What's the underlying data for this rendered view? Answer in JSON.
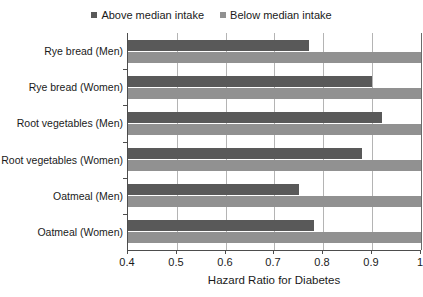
{
  "chart_data": {
    "type": "bar",
    "orientation": "horizontal",
    "title": "",
    "xlabel": "Hazard Ratio for Diabetes",
    "ylabel": "",
    "xlim": [
      0.4,
      1.0
    ],
    "xticks": [
      "0.4",
      "0.5",
      "0.6",
      "0.7",
      "0.8",
      "0.9",
      "1"
    ],
    "xtick_values": [
      0.4,
      0.5,
      0.6,
      0.7,
      0.8,
      0.9,
      1.0
    ],
    "grid": true,
    "legend_position": "top-center",
    "categories": [
      "Rye bread (Men)",
      "Rye bread (Women)",
      "Root vegetables (Men)",
      "Root vegetables (Women)",
      "Oatmeal (Men)",
      "Oatmeal (Women)"
    ],
    "series": [
      {
        "name": "Above median intake",
        "color": "#595959",
        "values": [
          0.77,
          0.9,
          0.92,
          0.88,
          0.75,
          0.78
        ]
      },
      {
        "name": "Below median intake",
        "color": "#919191",
        "values": [
          1.0,
          1.0,
          1.0,
          1.0,
          1.0,
          1.0
        ]
      }
    ]
  },
  "legend": {
    "entries": [
      {
        "label": "Above median intake",
        "swatch": "above"
      },
      {
        "label": "Below median intake",
        "swatch": "below"
      }
    ]
  },
  "colors": {
    "above_median": "#595959",
    "below_median": "#919191",
    "gridline": "#b4b4b4",
    "axis": "#4d4d4d",
    "background": "#ffffff"
  }
}
